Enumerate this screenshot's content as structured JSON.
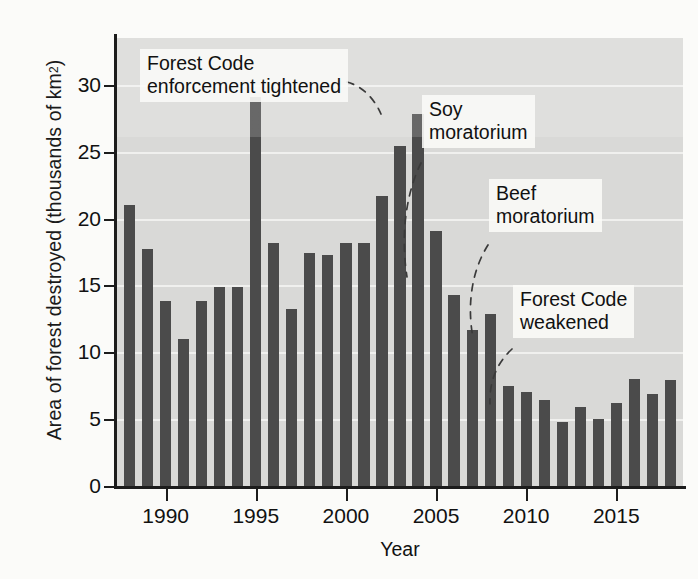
{
  "chart_data": {
    "type": "bar",
    "title": "",
    "xlabel": "Year",
    "ylabel": "Area of forest destroyed (thousands of km²)",
    "ylabel_main": "Area of forest destroyed (thousands of km",
    "ylabel_sup": "2",
    "ylabel_tail": ")",
    "xlim": [
      1987.3,
      2018.7
    ],
    "ylim": [
      0,
      33.5
    ],
    "grid": true,
    "legend": "none",
    "ytick_labels": [
      "0",
      "5",
      "10",
      "15",
      "20",
      "25",
      "30"
    ],
    "ytick_values": [
      0,
      5,
      10,
      15,
      20,
      25,
      30
    ],
    "xtick_labels": [
      "1990",
      "1995",
      "2000",
      "2005",
      "2010",
      "2015"
    ],
    "xtick_values": [
      1990,
      1995,
      2000,
      2005,
      2010,
      2015
    ],
    "categories": [
      1988,
      1989,
      1990,
      1991,
      1992,
      1993,
      1994,
      1995,
      1996,
      1997,
      1998,
      1999,
      2000,
      2001,
      2002,
      2003,
      2004,
      2005,
      2006,
      2007,
      2008,
      2009,
      2010,
      2011,
      2012,
      2013,
      2014,
      2015,
      2016,
      2017,
      2018
    ],
    "values": [
      21.0,
      17.7,
      13.8,
      11.0,
      13.8,
      14.9,
      14.9,
      29.1,
      18.2,
      13.2,
      17.4,
      17.3,
      18.2,
      18.2,
      21.7,
      25.4,
      27.8,
      19.1,
      14.3,
      11.7,
      12.9,
      7.5,
      7.0,
      6.4,
      4.8,
      5.9,
      5.0,
      6.2,
      8.0,
      6.9,
      7.9
    ],
    "annotations": [
      {
        "id": "forest-code-tightened",
        "text": "Forest Code\nenforcement tightened"
      },
      {
        "id": "soy-moratorium",
        "text": "Soy\nmoratorium"
      },
      {
        "id": "beef-moratorium",
        "text": "Beef\nmoratorium"
      },
      {
        "id": "forest-code-weakened",
        "text": "Forest Code\nweakened"
      }
    ],
    "colors": {
      "bar": "#4b4b4b",
      "plot_background": "#d9d9d7",
      "page_background": "#fbfbf9",
      "gridline": "#f2f2f0",
      "axis": "#1c1c1c",
      "text": "#111111"
    }
  }
}
